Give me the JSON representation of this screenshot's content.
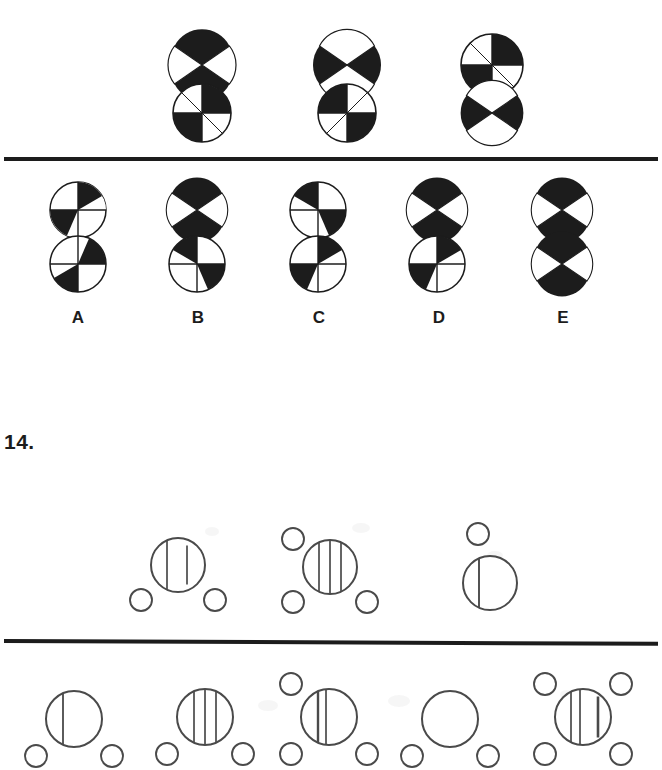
{
  "page": {
    "width": 662,
    "height": 749,
    "background": "#ffffff",
    "ink": "#1c1c1c",
    "outline": "#3a3a3a"
  },
  "question_13": {
    "stimulus_label": "",
    "stimulus": [
      {
        "name": "stimulus-figure-1",
        "top_circle": {
          "style": "x-cross",
          "black": [
            "top",
            "bottom"
          ]
        },
        "bottom_circle": {
          "style": "plus-cross",
          "black": [
            "top-right",
            "bottom-left"
          ]
        }
      },
      {
        "name": "stimulus-figure-2",
        "top_circle": {
          "style": "x-cross",
          "black": [
            "left",
            "right"
          ]
        },
        "bottom_circle": {
          "style": "plus-cross",
          "black": [
            "top-left",
            "bottom-right"
          ]
        }
      },
      {
        "name": "stimulus-figure-3",
        "top_circle": {
          "style": "plus-cross",
          "black": [
            "top-right",
            "bottom-left"
          ]
        },
        "bottom_circle": {
          "style": "x-cross",
          "black": [
            "left",
            "right"
          ]
        }
      }
    ],
    "options": [
      {
        "letter": "A",
        "top_circle": {
          "style": "plus-cross",
          "black": [
            "tr-upper-half",
            "bl-lower-half"
          ]
        },
        "bottom_circle": {
          "style": "plus-cross",
          "black": [
            "tr-lower-half",
            "bl-lower-half"
          ]
        }
      },
      {
        "letter": "B",
        "top_circle": {
          "style": "x-cross",
          "black": [
            "top",
            "bottom"
          ]
        },
        "bottom_circle": {
          "style": "plus-cross",
          "black": [
            "tl-upper-half",
            "br-lower-half"
          ]
        }
      },
      {
        "letter": "C",
        "top_circle": {
          "style": "plus-cross",
          "black": [
            "tl-upper-half",
            "br-lower-half"
          ]
        },
        "bottom_circle": {
          "style": "plus-cross",
          "black": [
            "tr-upper-half",
            "bl-lower-half"
          ]
        }
      },
      {
        "letter": "D",
        "top_circle": {
          "style": "x-cross",
          "black": [
            "top",
            "bottom"
          ]
        },
        "bottom_circle": {
          "style": "plus-cross",
          "black": [
            "tr-upper-half",
            "bl-lower-half"
          ]
        }
      },
      {
        "letter": "E",
        "top_circle": {
          "style": "x-cross",
          "black": [
            "top",
            "bottom"
          ]
        },
        "bottom_circle": {
          "style": "x-cross",
          "black": [
            "top",
            "bottom"
          ]
        }
      }
    ]
  },
  "question_14": {
    "number_label": "14.",
    "stimulus": [
      {
        "name": "stimulus-figure-1",
        "main_circle_lines": 2,
        "small_circles": [
          "bottom-left",
          "bottom-right"
        ]
      },
      {
        "name": "stimulus-figure-2",
        "main_circle_lines": 3,
        "small_circles": [
          "top-left",
          "bottom-left",
          "bottom-right"
        ]
      },
      {
        "name": "stimulus-figure-3",
        "main_circle_lines": 1,
        "small_circles": [
          "top-left"
        ]
      }
    ],
    "options": [
      {
        "letter": "A",
        "main_circle_lines": 1,
        "small_circles": [
          "bottom-left",
          "bottom-right"
        ]
      },
      {
        "letter": "B",
        "main_circle_lines": 3,
        "small_circles": [
          "bottom-left",
          "bottom-right"
        ]
      },
      {
        "letter": "C",
        "main_circle_lines": 2,
        "small_circles": [
          "top-left",
          "bottom-left",
          "bottom-right"
        ]
      },
      {
        "letter": "D",
        "main_circle_lines": 0,
        "small_circles": [
          "bottom-left",
          "bottom-right"
        ]
      },
      {
        "letter": "E",
        "main_circle_lines": 3,
        "small_circles": [
          "top-left",
          "top-right",
          "bottom-left",
          "bottom-right"
        ]
      }
    ]
  }
}
